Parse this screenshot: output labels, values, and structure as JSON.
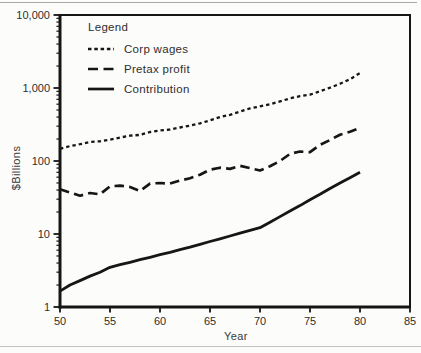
{
  "chart_data": {
    "type": "line",
    "title": "",
    "xlabel": "Year",
    "ylabel": "$Billions",
    "x_axis": {
      "min": 50,
      "max": 85,
      "ticks": [
        50,
        55,
        60,
        65,
        70,
        75,
        80,
        85
      ],
      "tick_labels": [
        "50",
        "55",
        "60",
        "65",
        "70",
        "75",
        "80",
        "85"
      ]
    },
    "y_axis": {
      "scale": "log",
      "min": 1,
      "max": 10000,
      "ticks": [
        1,
        10,
        100,
        1000,
        10000
      ],
      "tick_labels": [
        "1",
        "10",
        "100",
        "1,000",
        "10,000"
      ]
    },
    "grid": false,
    "legend": {
      "title": "Legend",
      "position": "top-left"
    },
    "line_color": "#161616",
    "x": [
      50,
      51,
      52,
      53,
      54,
      55,
      56,
      57,
      58,
      59,
      60,
      61,
      62,
      63,
      64,
      65,
      66,
      67,
      68,
      69,
      70,
      71,
      72,
      73,
      74,
      75,
      76,
      77,
      78,
      79,
      80
    ],
    "series": [
      {
        "name": "Corp wages",
        "line_style": "dotted",
        "values": [
          147,
          160,
          170,
          182,
          186,
          196,
          210,
          222,
          228,
          250,
          262,
          270,
          288,
          305,
          328,
          360,
          400,
          430,
          475,
          525,
          560,
          600,
          655,
          720,
          775,
          810,
          900,
          1010,
          1140,
          1320,
          1600
        ]
      },
      {
        "name": "Pretax profit",
        "line_style": "dashed",
        "values": [
          41,
          37,
          33.5,
          36.5,
          35,
          45,
          46,
          44,
          39,
          49,
          50,
          49,
          54,
          58,
          65,
          76,
          81,
          78,
          86,
          80,
          74,
          85,
          100,
          125,
          135,
          132,
          166,
          194,
          229,
          252,
          284
        ]
      },
      {
        "name": "Contribution",
        "line_style": "solid",
        "values": [
          1.65,
          2.0,
          2.3,
          2.65,
          3.0,
          3.5,
          3.8,
          4.1,
          4.45,
          4.8,
          5.2,
          5.6,
          6.1,
          6.6,
          7.2,
          7.9,
          8.6,
          9.4,
          10.3,
          11.2,
          12.2,
          14.5,
          17.3,
          20.6,
          24.5,
          29.5,
          35,
          42,
          50,
          59,
          70
        ]
      }
    ]
  }
}
